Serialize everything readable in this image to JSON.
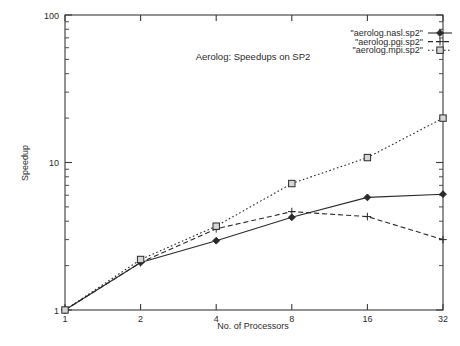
{
  "chart_data": {
    "type": "line",
    "title": "Aerolog: Speedups on SP2",
    "xlabel": "No. of Processors",
    "ylabel": "Speedup",
    "xscale": "log",
    "yscale": "log",
    "xlim": [
      1,
      32
    ],
    "ylim": [
      1,
      100
    ],
    "grid": false,
    "legend_position": "top-right",
    "x": [
      1,
      2,
      4,
      8,
      16,
      32
    ],
    "xticklabels": [
      "1",
      "2",
      "4",
      "8",
      "16",
      "32"
    ],
    "yticklabels": [
      "1",
      "10",
      "100"
    ],
    "yticks": [
      1,
      10,
      100
    ],
    "series": [
      {
        "name": "\"aerolog.nasl.sp2\"",
        "marker": "diamond",
        "linestyle": "solid",
        "values": [
          1.0,
          2.1,
          2.95,
          4.25,
          5.8,
          6.1
        ]
      },
      {
        "name": "\"aerolog.pgi.sp2\"",
        "marker": "plus",
        "linestyle": "dashed",
        "values": [
          1.0,
          2.1,
          3.55,
          4.65,
          4.3,
          3.0
        ]
      },
      {
        "name": "\"aerolog.mpi.sp2\"",
        "marker": "square",
        "linestyle": "dotted",
        "values": [
          1.0,
          2.2,
          3.7,
          7.2,
          10.8,
          20.0
        ]
      }
    ]
  },
  "legend": {
    "entries": [
      {
        "label": "\"aerolog.nasl.sp2\""
      },
      {
        "label": "\"aerolog.pgi.sp2\""
      },
      {
        "label": "\"aerolog.mpi.sp2\""
      }
    ]
  }
}
